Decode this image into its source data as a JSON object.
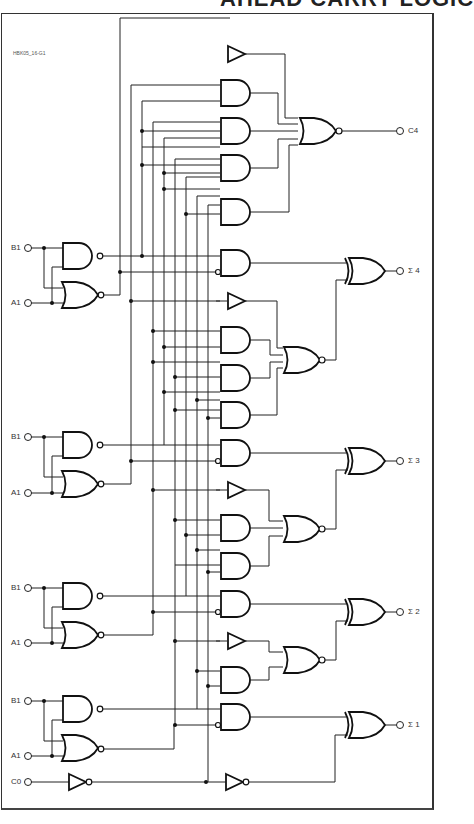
{
  "heading": {
    "text": "AHEAD CARRY LOGIC",
    "clipped": true
  },
  "figure_id": "HBK05_16-G1",
  "inputs": [
    {
      "label": "B1",
      "y": 245
    },
    {
      "label": "A1",
      "y": 302
    },
    {
      "label": "B1",
      "y": 440
    },
    {
      "label": "A1",
      "y": 495
    },
    {
      "label": "B1",
      "y": 588
    },
    {
      "label": "A1",
      "y": 643
    },
    {
      "label": "B1",
      "y": 700
    },
    {
      "label": "A1",
      "y": 756
    },
    {
      "label": "C0",
      "y": 782
    }
  ],
  "outputs": [
    {
      "label": "C4",
      "y": 131
    },
    {
      "label": "Σ 4",
      "y": 273
    },
    {
      "label": "Σ 3",
      "y": 462
    },
    {
      "label": "Σ 2",
      "y": 612
    },
    {
      "label": "Σ 1",
      "y": 725
    }
  ],
  "gate_counts": {
    "nand": 4,
    "nor_input": 4,
    "and": 15,
    "nor": 4,
    "xor": 4,
    "buffer": 4,
    "inverter": 2
  },
  "colors": {
    "line": "#222222",
    "background": "#ffffff",
    "frame": "#333333"
  }
}
